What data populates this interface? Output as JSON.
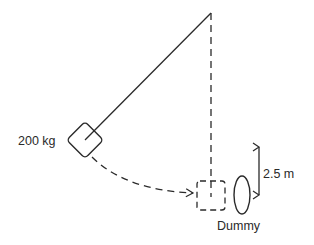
{
  "diagram": {
    "type": "pendulum-impact",
    "mass_label": "200 kg",
    "height_label": "2.5 m",
    "target_label": "Dummy",
    "colors": {
      "stroke": "#2a2a2a",
      "background": "#ffffff"
    }
  }
}
